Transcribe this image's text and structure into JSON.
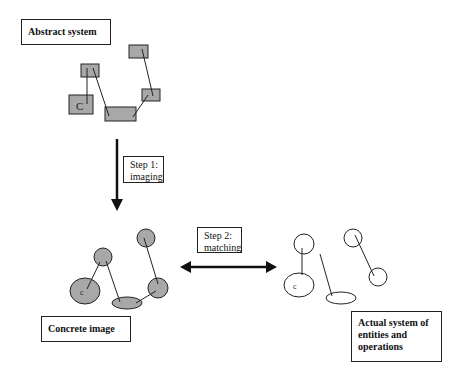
{
  "labels": {
    "abstract_system": "Abstract system",
    "step1": {
      "line1": "Step 1:",
      "line2": "imaging"
    },
    "step2": {
      "line1": "Step 2:",
      "line2": "matching"
    },
    "concrete_image": "Concrete image",
    "actual_system": {
      "line1": "Actual system of",
      "line2": "entities and",
      "line3": "operations"
    }
  },
  "node_marker": "C",
  "colors": {
    "fill_gray": "#a8a8a8",
    "stroke": "#222222",
    "background": "#ffffff"
  }
}
